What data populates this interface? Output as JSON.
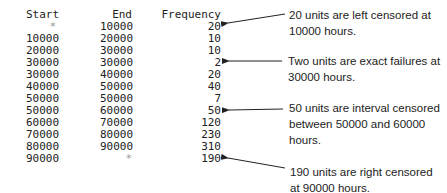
{
  "table": {
    "headers": {
      "start": "Start",
      "end": "End",
      "frequency": "Frequency"
    },
    "rows": [
      {
        "start": "*",
        "end": "10000",
        "frequency": "20"
      },
      {
        "start": "10000",
        "end": "20000",
        "frequency": "10"
      },
      {
        "start": "20000",
        "end": "30000",
        "frequency": "10"
      },
      {
        "start": "30000",
        "end": "30000",
        "frequency": "2"
      },
      {
        "start": "30000",
        "end": "40000",
        "frequency": "20"
      },
      {
        "start": "40000",
        "end": "50000",
        "frequency": "40"
      },
      {
        "start": "50000",
        "end": "50000",
        "frequency": "7"
      },
      {
        "start": "50000",
        "end": "60000",
        "frequency": "50"
      },
      {
        "start": "60000",
        "end": "70000",
        "frequency": "120"
      },
      {
        "start": "70000",
        "end": "80000",
        "frequency": "230"
      },
      {
        "start": "80000",
        "end": "90000",
        "frequency": "310"
      },
      {
        "start": "90000",
        "end": "*",
        "frequency": "190"
      }
    ]
  },
  "annotations": [
    {
      "line1": "20 units are left censored at",
      "line2": "10000 hours."
    },
    {
      "line1": "Two units are exact failures at",
      "line2": "30000 hours."
    },
    {
      "line1": "50 units are interval censored",
      "line2": "between 50000 and 60000",
      "line3": "hours."
    },
    {
      "line1": "190 units are right censored",
      "line2": "at 90000 hours."
    }
  ]
}
